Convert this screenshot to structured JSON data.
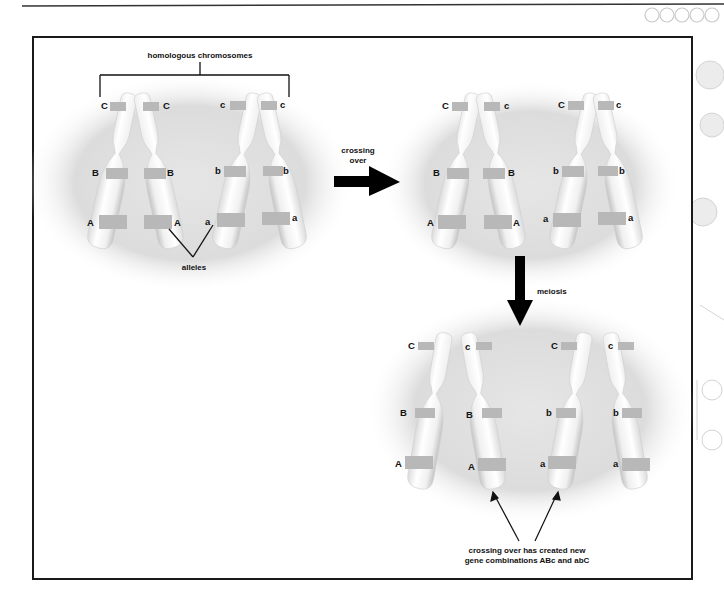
{
  "figure": {
    "title_bracket_label": "homologous chromosomes",
    "alleles_label": "alleles",
    "crossing_over_label_line1": "crossing",
    "crossing_over_label_line2": "over",
    "meiosis_label": "meiosis",
    "caption_line1": "crossing over has created new",
    "caption_line2": "gene combinations ABc and abC"
  },
  "panels": {
    "before": {
      "pair1": {
        "left": {
          "top": "C",
          "mid": "B",
          "bottom": "A"
        },
        "right": {
          "top": "C",
          "mid": "B",
          "bottom": "A"
        }
      },
      "pair2": {
        "left": {
          "top": "c",
          "mid": "b",
          "bottom": "a"
        },
        "right": {
          "top": "c",
          "mid": "b",
          "bottom": "a"
        }
      }
    },
    "after_crossing": {
      "pair1": {
        "left": {
          "top": "C",
          "mid": "B",
          "bottom": "A"
        },
        "right": {
          "top": "c",
          "mid": "B",
          "bottom": "A"
        }
      },
      "pair2": {
        "left": {
          "top": "C",
          "mid": "b",
          "bottom": "a"
        },
        "right": {
          "top": "c",
          "mid": "b",
          "bottom": "a"
        }
      }
    },
    "after_meiosis": {
      "chromosomes": [
        {
          "top": "C",
          "mid": "B",
          "bottom": "A"
        },
        {
          "top": "c",
          "mid": "B",
          "bottom": "A"
        },
        {
          "top": "C",
          "mid": "b",
          "bottom": "a"
        },
        {
          "top": "c",
          "mid": "b",
          "bottom": "a"
        }
      ]
    }
  },
  "colors": {
    "ellipse": "#d9d9d9",
    "chromosome": "#f2f2f2",
    "band": "#b8b8b8",
    "frame": "#1a1a1a",
    "arrow": "#000000"
  }
}
